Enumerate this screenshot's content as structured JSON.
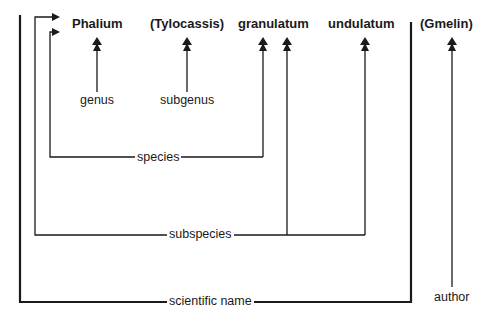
{
  "diagram": {
    "names": {
      "genus": "Phalium",
      "subgenus": "(Tylocassis)",
      "species": "granulatum",
      "subspecies": "undulatum",
      "author": "(Gmelin)"
    },
    "labels": {
      "genus": "genus",
      "subgenus": "subgenus",
      "species": "species",
      "subspecies": "subspecies",
      "scientific_name": "scientific name",
      "author": "author"
    },
    "colors": {
      "line": "#1a1a1a",
      "background": "#ffffff"
    }
  }
}
